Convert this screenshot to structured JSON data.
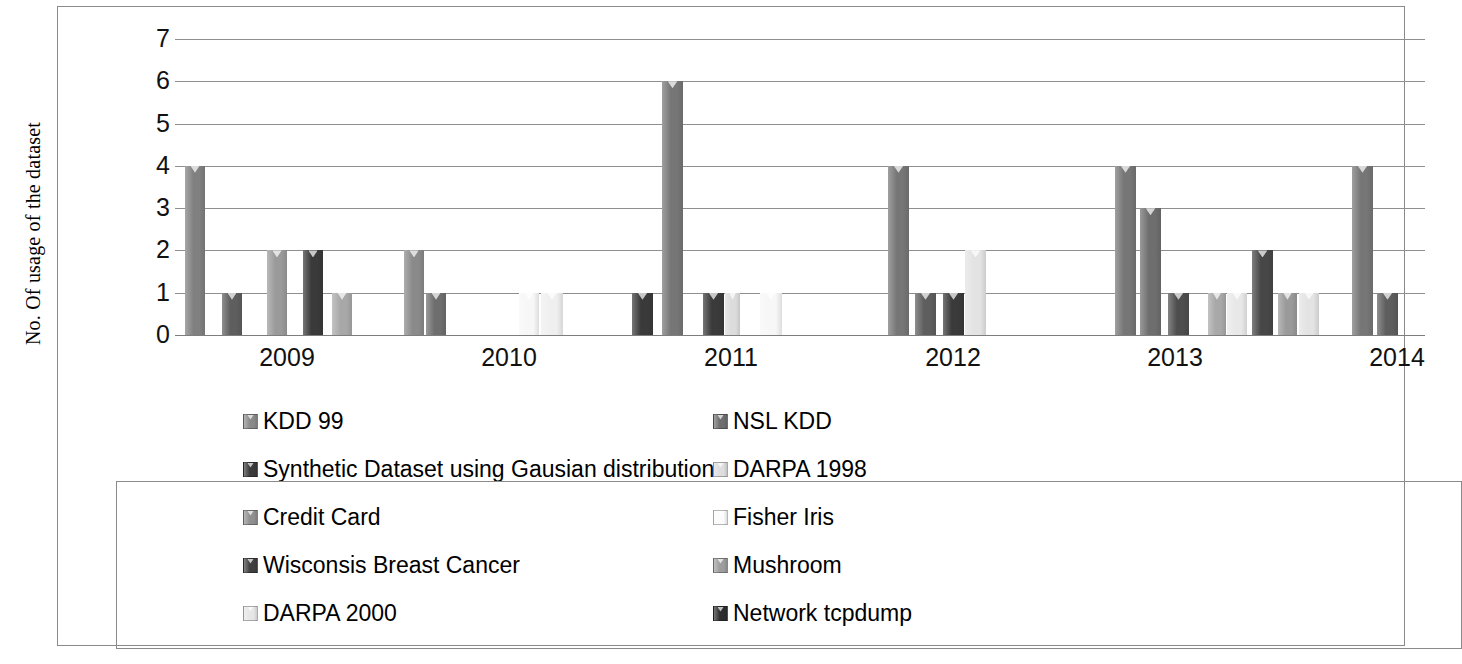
{
  "chart_data": {
    "type": "bar",
    "title": "",
    "xlabel": "",
    "ylabel": "No. Of usage of the dataset",
    "ylim": [
      0,
      7
    ],
    "y_ticks": [
      0,
      1,
      2,
      3,
      4,
      5,
      6,
      7
    ],
    "y_tick_labels": [
      "0",
      "1",
      "2",
      "3",
      "4",
      "5",
      "6",
      "7"
    ],
    "grid": true,
    "legend_position": "bottom",
    "categories": [
      "2009",
      "2010",
      "2011",
      "2012",
      "2013",
      "2014"
    ],
    "series": [
      {
        "name": "KDD 99",
        "color": "#808080",
        "values": [
          4,
          2,
          6,
          4,
          4,
          0
        ]
      },
      {
        "name": "NSL KDD",
        "color": "#6e6e6e",
        "values": [
          1,
          1,
          1,
          1,
          3,
          1
        ]
      },
      {
        "name": "Synthetic Dataset using Gausian distribution",
        "color": "#3a3a3a",
        "values": [
          2,
          0,
          1,
          1,
          1,
          0
        ]
      },
      {
        "name": "DARPA 1998",
        "color": "#d9d9d9",
        "values": [
          0,
          1,
          1,
          0,
          1,
          0
        ]
      },
      {
        "name": "Credit Card",
        "color": "#9a9a9a",
        "values": [
          2,
          0,
          0,
          1,
          1,
          0
        ]
      },
      {
        "name": "Fisher Iris",
        "color": "#f2f2f2",
        "values": [
          1,
          1,
          1,
          0,
          0,
          0
        ]
      },
      {
        "name": "Wisconsis Breast Cancer",
        "color": "#474747",
        "values": [
          0,
          0,
          0,
          0,
          2,
          0
        ]
      },
      {
        "name": "Mushroom",
        "color": "#8c8c8c",
        "values": [
          1,
          0,
          0,
          0,
          1,
          0
        ]
      },
      {
        "name": "DARPA 2000",
        "color": "#e3e3e3",
        "values": [
          0,
          0,
          0,
          2,
          1,
          0
        ]
      },
      {
        "name": "Network tcpdump",
        "color": "#2e2e2e",
        "values": [
          0,
          0,
          0,
          0,
          0,
          0
        ]
      }
    ],
    "bars": [
      {
        "label": "KDD 99",
        "x": 10,
        "value": 4,
        "color": "#808080",
        "width": 20
      },
      {
        "label": "NSL KDD",
        "x": 47,
        "value": 1,
        "color": "#5e5e5e",
        "width": 20
      },
      {
        "label": "Credit Card",
        "x": 92,
        "value": 2,
        "color": "#9a9a9a",
        "width": 20
      },
      {
        "label": "Synthetic Dataset using Gausian distribution",
        "x": 128,
        "value": 2,
        "color": "#3a3a3a",
        "width": 20
      },
      {
        "label": "Mushroom",
        "x": 157,
        "value": 1,
        "color": "#a8a8a8",
        "width": 20
      },
      {
        "label": "KDD 99",
        "x": 229,
        "value": 2,
        "color": "#8a8a8a",
        "width": 20
      },
      {
        "label": "NSL KDD",
        "x": 251,
        "value": 1,
        "color": "#6e6e6e",
        "width": 20
      },
      {
        "label": "Fisher Iris",
        "x": 344,
        "value": 1,
        "color": "#f7f7f7",
        "width": 20
      },
      {
        "label": "DARPA 1998",
        "x": 366,
        "value": 1,
        "color": "#efefef",
        "width": 22
      },
      {
        "label": "Synthetic Dataset using Gausian distribution",
        "x": 457,
        "value": 1,
        "color": "#3a3a3a",
        "width": 21
      },
      {
        "label": "KDD 99",
        "x": 487,
        "value": 6,
        "color": "#767676",
        "width": 21
      },
      {
        "label": "Network tcpdump",
        "x": 528,
        "value": 1,
        "color": "#3a3a3a",
        "width": 21
      },
      {
        "label": "DARPA 1998",
        "x": 550,
        "value": 1,
        "color": "#dcdcdc",
        "width": 15
      },
      {
        "label": "Fisher Iris",
        "x": 585,
        "value": 1,
        "color": "#f7f7f7",
        "width": 22
      },
      {
        "label": "KDD 99",
        "x": 713,
        "value": 4,
        "color": "#767676",
        "width": 21
      },
      {
        "label": "NSL KDD",
        "x": 740,
        "value": 1,
        "color": "#5e5e5e",
        "width": 21
      },
      {
        "label": "Synthetic Dataset using Gausian distribution",
        "x": 768,
        "value": 1,
        "color": "#3a3a3a",
        "width": 21
      },
      {
        "label": "DARPA 2000",
        "x": 790,
        "value": 2,
        "color": "#e3e3e3",
        "width": 21
      },
      {
        "label": "KDD 99",
        "x": 940,
        "value": 4,
        "color": "#767676",
        "width": 21
      },
      {
        "label": "NSL KDD",
        "x": 965,
        "value": 3,
        "color": "#6e6e6e",
        "width": 21
      },
      {
        "label": "Credit Card",
        "x": 993,
        "value": 1,
        "color": "#4e4e4e",
        "width": 21
      },
      {
        "label": "Mushroom",
        "x": 1033,
        "value": 1,
        "color": "#a8a8a8",
        "width": 18
      },
      {
        "label": "DARPA 1998",
        "x": 1052,
        "value": 1,
        "color": "#e8e8e8",
        "width": 20
      },
      {
        "label": "Wisconsis Breast Cancer",
        "x": 1077,
        "value": 2,
        "color": "#474747",
        "width": 21
      },
      {
        "label": "Credit Card",
        "x": 1103,
        "value": 1,
        "color": "#9a9a9a",
        "width": 19
      },
      {
        "label": "DARPA 2000",
        "x": 1124,
        "value": 1,
        "color": "#e3e3e3",
        "width": 20
      },
      {
        "label": "KDD 99",
        "x": 1177,
        "value": 4,
        "color": "#767676",
        "width": 21
      },
      {
        "label": "NSL KDD",
        "x": 1202,
        "value": 1,
        "color": "#5e5e5e",
        "width": 21
      }
    ],
    "x_tick_positions": [
      112,
      334,
      556,
      778,
      1000,
      1222
    ]
  },
  "axis": {
    "y_title": "No. Of usage of the dataset",
    "y_labels": [
      "7",
      "6",
      "5",
      "4",
      "3",
      "2",
      "1",
      "0"
    ],
    "x_labels": [
      "2009",
      "2010",
      "2011",
      "2012",
      "2013",
      "2014"
    ]
  },
  "legend": {
    "rows": [
      {
        "left": {
          "label": "KDD 99",
          "color": "#8a8a8a"
        },
        "right": {
          "label": "NSL KDD",
          "color": "#6e6e6e"
        }
      },
      {
        "left": {
          "label": "Synthetic Dataset using Gausian distribution",
          "color": "#3a3a3a"
        },
        "right": {
          "label": "DARPA 1998",
          "color": "#dedede"
        }
      },
      {
        "left": {
          "label": "Credit Card",
          "color": "#8f8f8f"
        },
        "right": {
          "label": "Fisher Iris",
          "color": "#fbfbfb"
        }
      },
      {
        "left": {
          "label": "Wisconsis Breast Cancer",
          "color": "#3f3f3f"
        },
        "right": {
          "label": "Mushroom",
          "color": "#9d9d9d"
        }
      },
      {
        "left": {
          "label": "DARPA 2000",
          "color": "#e6e6e6"
        },
        "right": {
          "label": "Network tcpdump",
          "color": "#2e2e2e"
        }
      }
    ]
  }
}
